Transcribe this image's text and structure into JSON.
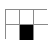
{
  "icon": {
    "name": "table-layout-icon",
    "rows": 2,
    "columns": 3,
    "selected_cell": {
      "row": 2,
      "column": 2
    },
    "colors": {
      "border": "#8a8a8a",
      "fill": "#000000",
      "background": "#ffffff"
    }
  }
}
